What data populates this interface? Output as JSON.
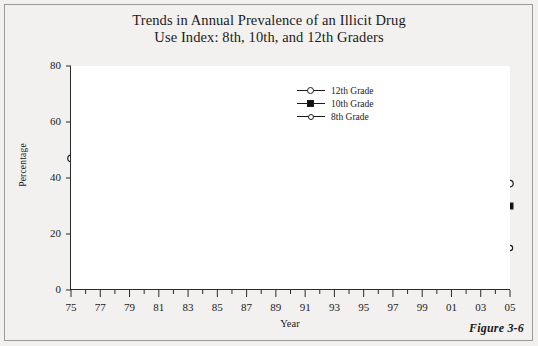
{
  "figure": {
    "title_line1": "Trends in Annual Prevalence of an Illicit Drug",
    "title_line2": "Use Index: 8th, 10th, and 12th Graders",
    "caption": "Figure 3-6"
  },
  "legend": {
    "position": "top-center-right",
    "items": [
      {
        "label": "12th Grade",
        "marker": "circle-open"
      },
      {
        "label": "10th Grade",
        "marker": "square-filled"
      },
      {
        "label": "8th Grade",
        "marker": "circle-small"
      }
    ]
  },
  "axes": {
    "ylabel": "Percentage",
    "xlabel": "Year",
    "ytick_labels": [
      "80",
      "60",
      "40",
      "20",
      "0"
    ],
    "xtick_labels": [
      "75",
      "77",
      "79",
      "81",
      "83",
      "85",
      "87",
      "89",
      "91",
      "93",
      "95",
      "97",
      "99",
      "01",
      "03",
      "05"
    ]
  },
  "colors": {
    "line": "#1b1b1b",
    "page_background": "#f2f1ef",
    "plot_background": "#ffffff",
    "axis": "#2a2a2a"
  },
  "chart_data": {
    "type": "line",
    "title": "Trends in Annual Prevalence of an Illicit Drug Use Index: 8th, 10th, and 12th Graders",
    "xlabel": "Year",
    "ylabel": "Percentage",
    "xlim": [
      1975,
      2005
    ],
    "ylim": [
      0,
      80
    ],
    "yticks": [
      0,
      20,
      40,
      60,
      80
    ],
    "xticks": [
      1975,
      1977,
      1979,
      1981,
      1983,
      1985,
      1987,
      1989,
      1991,
      1993,
      1995,
      1997,
      1999,
      2001,
      2003,
      2005
    ],
    "grid": false,
    "legend": [
      "12th Grade",
      "10th Grade",
      "8th Grade"
    ],
    "series": [
      {
        "name": "12th Grade",
        "marker": "circle-open",
        "x": [
          1975,
          1976,
          1977,
          1978,
          1979,
          1980,
          1981,
          1982,
          1983,
          1984,
          1985,
          1986,
          1987,
          1988,
          1989,
          1990,
          1991,
          1992,
          1993,
          1994,
          1995,
          1996,
          1997,
          1998,
          1999,
          2000,
          2001,
          2002,
          2003,
          2004,
          2005
        ],
        "values": [
          47,
          48,
          51,
          53,
          54,
          54,
          53,
          51,
          49,
          46,
          46,
          45,
          42,
          38,
          36,
          33,
          29,
          27,
          31,
          36,
          39,
          40,
          42,
          41,
          42,
          41,
          41,
          41,
          39,
          39,
          38
        ]
      },
      {
        "name": "10th Grade",
        "marker": "square-filled",
        "x": [
          1991,
          1992,
          1993,
          1994,
          1995,
          1996,
          1997,
          1998,
          1999,
          2000,
          2001,
          2002,
          2003,
          2004,
          2005
        ],
        "values": [
          21,
          20,
          24,
          30,
          33,
          38,
          39,
          35,
          36,
          37,
          37,
          35,
          33,
          31,
          30
        ]
      },
      {
        "name": "8th Grade",
        "marker": "circle-small",
        "x": [
          1991,
          1992,
          1993,
          1994,
          1995,
          1996,
          1997,
          1998,
          1999,
          2000,
          2001,
          2002,
          2003,
          2004,
          2005
        ],
        "values": [
          12,
          13,
          15,
          18,
          21,
          24,
          22,
          21,
          20,
          20,
          19,
          18,
          16,
          15,
          15
        ]
      }
    ]
  }
}
